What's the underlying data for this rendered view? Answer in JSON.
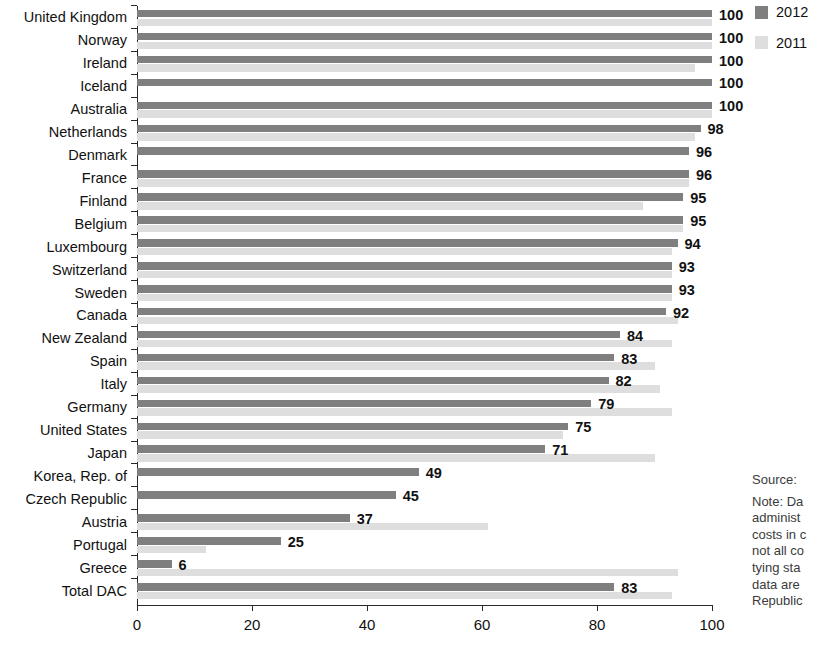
{
  "legend": {
    "items": [
      {
        "label": "2012",
        "color": "#7f7f7f",
        "key": "2012"
      },
      {
        "label": "2011",
        "color": "#dedede",
        "key": "2011"
      }
    ]
  },
  "side": {
    "source_label": "Source:",
    "note_lines": [
      "Note:  Da",
      "administ",
      "costs in c",
      "not all co",
      "tying sta",
      "data are",
      "Republic"
    ]
  },
  "chart_data": {
    "type": "bar",
    "orientation": "horizontal",
    "title": "",
    "xlabel": "",
    "ylabel": "",
    "xlim": [
      0,
      100
    ],
    "xticks": [
      0,
      20,
      40,
      60,
      80,
      100
    ],
    "grid": false,
    "legend_position": "top-right",
    "value_labels_series": "2012",
    "categories": [
      "United Kingdom",
      "Norway",
      "Ireland",
      "Iceland",
      "Australia",
      "Netherlands",
      "Denmark",
      "France",
      "Finland",
      "Belgium",
      "Luxembourg",
      "Switzerland",
      "Sweden",
      "Canada",
      "New Zealand",
      "Spain",
      "Italy",
      "Germany",
      "United States",
      "Japan",
      "Korea, Rep. of",
      "Czech Republic",
      "Austria",
      "Portugal",
      "Greece",
      "Total DAC"
    ],
    "series": [
      {
        "name": "2012",
        "color": "#7f7f7f",
        "values": [
          100,
          100,
          100,
          100,
          100,
          98,
          96,
          96,
          95,
          95,
          94,
          93,
          93,
          92,
          84,
          83,
          82,
          79,
          75,
          71,
          49,
          45,
          37,
          25,
          6,
          83
        ]
      },
      {
        "name": "2011",
        "color": "#dedede",
        "values": [
          100,
          100,
          97,
          0,
          100,
          97,
          0,
          96,
          88,
          95,
          93,
          93,
          93,
          94,
          93,
          90,
          91,
          93,
          74,
          90,
          0,
          0,
          61,
          12,
          94,
          93
        ]
      }
    ],
    "data_labels": [
      "100",
      "100",
      "100",
      "100",
      "100",
      "98",
      "96",
      "96",
      "95",
      "95",
      "94",
      "93",
      "93",
      "92",
      "84",
      "83",
      "82",
      "79",
      "75",
      "71",
      "49",
      "45",
      "37",
      "25",
      "6",
      "83"
    ]
  }
}
